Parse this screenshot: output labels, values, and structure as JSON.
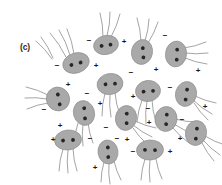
{
  "figure": {
    "panel_label": "(c)",
    "panel_label_x": 20,
    "panel_label_y": 42,
    "width": 222,
    "height": 185,
    "background_color": "#ffffff",
    "cell_fill_color": "#a9a9a9",
    "cell_stroke_color": "#8f8f8f",
    "granule_color": "#262626",
    "flagellum_color": "#9a9a9a",
    "charge_symbol_color": "#1a1a1a"
  },
  "chart_data": {
    "type": "scatter",
    "title": "(c)",
    "xlabel": "",
    "ylabel": "",
    "xlim": [
      0,
      222
    ],
    "ylim": [
      0,
      185
    ],
    "grid": false,
    "legend": "none",
    "cell_count": 16,
    "charge_count": 28,
    "cells": [
      {
        "id": "cell-1",
        "cx": 76,
        "cy": 63,
        "rx": 13.5,
        "ry": 10.0,
        "rot": -18,
        "granules": [
          [
            -5.0,
            0.5
          ],
          [
            4.5,
            1.0
          ]
        ],
        "flagella": [
          [
            -10,
            -6,
            -26,
            -30
          ],
          [
            -6,
            -8,
            -17,
            -33
          ],
          [
            -2,
            -9,
            -9,
            -34
          ]
        ]
      },
      {
        "id": "cell-2",
        "cx": 106,
        "cy": 45,
        "rx": 12.5,
        "ry": 9.5,
        "rot": -12,
        "granules": [
          [
            -4.5,
            0.0
          ],
          [
            4.5,
            0.5
          ]
        ],
        "flagella": [
          [
            -3,
            -8,
            -6,
            -32
          ],
          [
            1,
            -9,
            4,
            -33
          ],
          [
            5,
            -8,
            14,
            -31
          ]
        ]
      },
      {
        "id": "cell-3",
        "cx": 142,
        "cy": 52,
        "rx": 10.5,
        "ry": 12.5,
        "rot": 12,
        "granules": [
          [
            0.0,
            -4.0
          ],
          [
            2.5,
            5.0
          ]
        ],
        "flagella": [
          [
            -1,
            -11,
            -5,
            -34
          ],
          [
            3,
            -11,
            7,
            -33
          ],
          [
            6,
            -9,
            16,
            -30
          ]
        ]
      },
      {
        "id": "cell-4",
        "cx": 176,
        "cy": 54,
        "rx": 10.5,
        "ry": 13.0,
        "rot": 8,
        "granules": [
          [
            0.5,
            -4.5
          ],
          [
            1.5,
            5.5
          ]
        ],
        "flagella": [
          [
            8,
            -6,
            30,
            -12
          ],
          [
            9,
            -1,
            32,
            -1
          ],
          [
            9,
            4,
            31,
            10
          ]
        ]
      },
      {
        "id": "cell-5",
        "cx": 58,
        "cy": 99,
        "rx": 11.5,
        "ry": 12.0,
        "rot": -28,
        "granules": [
          [
            2.0,
            -4.0
          ],
          [
            -1.0,
            5.5
          ]
        ],
        "flagella": [
          [
            -10,
            -4,
            -32,
            -12
          ],
          [
            -11,
            0,
            -33,
            -1
          ],
          [
            -10,
            4,
            -31,
            10
          ]
        ]
      },
      {
        "id": "cell-6",
        "cx": 110,
        "cy": 84,
        "rx": 13.0,
        "ry": 10.5,
        "rot": -10,
        "granules": [
          [
            -4.5,
            -0.5
          ],
          [
            5.0,
            0.5
          ]
        ],
        "flagella": [
          [
            -5,
            9,
            -8,
            32
          ],
          [
            0,
            10,
            1,
            33
          ],
          [
            5,
            9,
            10,
            31
          ]
        ]
      },
      {
        "id": "cell-7",
        "cx": 148,
        "cy": 91,
        "rx": 12.5,
        "ry": 10.5,
        "rot": -8,
        "granules": [
          [
            -4.5,
            0.0
          ],
          [
            5.0,
            0.5
          ]
        ],
        "flagella": [
          [
            -6,
            9,
            -11,
            31
          ],
          [
            -1,
            10,
            -2,
            33
          ],
          [
            4,
            9,
            8,
            31
          ]
        ]
      },
      {
        "id": "cell-8",
        "cx": 186,
        "cy": 94,
        "rx": 10.5,
        "ry": 12.5,
        "rot": 14,
        "granules": [
          [
            0.0,
            -4.5
          ],
          [
            1.0,
            5.5
          ]
        ],
        "flagella": [
          [
            7,
            6,
            26,
            20
          ],
          [
            9,
            2,
            30,
            9
          ],
          [
            8,
            9,
            22,
            26
          ]
        ]
      },
      {
        "id": "cell-9",
        "cx": 84,
        "cy": 113,
        "rx": 10.5,
        "ry": 12.5,
        "rot": -16,
        "granules": [
          [
            1.5,
            -4.5
          ],
          [
            -0.5,
            5.5
          ]
        ],
        "flagella": [
          [
            -6,
            10,
            -10,
            31
          ],
          [
            -1,
            11,
            -1,
            33
          ],
          [
            4,
            10,
            9,
            30
          ]
        ]
      },
      {
        "id": "cell-10",
        "cx": 126,
        "cy": 118,
        "rx": 10.5,
        "ry": 12.5,
        "rot": 10,
        "granules": [
          [
            0.0,
            -4.5
          ],
          [
            1.5,
            5.0
          ]
        ],
        "flagella": [
          [
            7,
            7,
            26,
            19
          ],
          [
            9,
            3,
            30,
            10
          ],
          [
            7,
            10,
            21,
            26
          ]
        ]
      },
      {
        "id": "cell-11",
        "cx": 166,
        "cy": 119,
        "rx": 11.0,
        "ry": 12.5,
        "rot": 10,
        "granules": [
          [
            0.0,
            -4.5
          ],
          [
            1.0,
            5.0
          ]
        ],
        "flagella": [
          [
            8,
            5,
            28,
            15
          ],
          [
            9,
            0,
            31,
            3
          ],
          [
            7,
            9,
            23,
            24
          ]
        ]
      },
      {
        "id": "cell-12",
        "cx": 196,
        "cy": 133,
        "rx": 10.5,
        "ry": 12.5,
        "rot": 12,
        "granules": [
          [
            0.0,
            -4.5
          ],
          [
            1.0,
            5.5
          ]
        ],
        "flagella": [
          [
            7,
            7,
            24,
            22
          ],
          [
            9,
            3,
            29,
            12
          ],
          [
            6,
            10,
            18,
            28
          ]
        ]
      },
      {
        "id": "cell-13",
        "cx": 68,
        "cy": 140,
        "rx": 13.5,
        "ry": 10.0,
        "rot": -6,
        "granules": [
          [
            -5.0,
            0.0
          ],
          [
            5.0,
            0.5
          ]
        ],
        "flagella": [
          [
            -5,
            9,
            -9,
            31
          ],
          [
            0,
            10,
            0,
            33
          ],
          [
            5,
            9,
            9,
            31
          ]
        ]
      },
      {
        "id": "cell-14",
        "cx": 108,
        "cy": 152,
        "rx": 10.0,
        "ry": 12.0,
        "rot": -8,
        "granules": [
          [
            0.5,
            -4.5
          ],
          [
            -0.5,
            5.0
          ]
        ],
        "flagella": [
          [
            -4,
            10,
            -7,
            30
          ],
          [
            1,
            11,
            2,
            32
          ],
          [
            6,
            9,
            13,
            28
          ]
        ]
      },
      {
        "id": "cell-15",
        "cx": 150,
        "cy": 150,
        "rx": 13.5,
        "ry": 10.0,
        "rot": -4,
        "granules": [
          [
            -5.0,
            -0.5
          ],
          [
            5.0,
            0.5
          ]
        ],
        "flagella": [
          [
            -5,
            9,
            -9,
            30
          ],
          [
            0,
            10,
            0,
            32
          ],
          [
            6,
            9,
            12,
            29
          ]
        ]
      },
      {
        "id": "cell-16",
        "cx": 54,
        "cy": 61,
        "rx": 0.1,
        "ry": 0.1,
        "rot": 0,
        "granules": [],
        "flagella": [
          [
            -2,
            -2,
            -18,
            -20
          ],
          [
            -1,
            -3,
            -13,
            -24
          ]
        ]
      }
    ],
    "charges": [
      {
        "sign": "−",
        "x": 57,
        "y": 66
      },
      {
        "sign": "+",
        "x": 96,
        "y": 66
      },
      {
        "sign": "−",
        "x": 89,
        "y": 41
      },
      {
        "sign": "+",
        "x": 124,
        "y": 42
      },
      {
        "sign": "+",
        "x": 156,
        "y": 70
      },
      {
        "sign": "−",
        "x": 165,
        "y": 36
      },
      {
        "sign": "+",
        "x": 198,
        "y": 71
      },
      {
        "sign": "+",
        "x": 68,
        "y": 85
      },
      {
        "sign": "−",
        "x": 44,
        "y": 110
      },
      {
        "sign": "−",
        "x": 87,
        "y": 94
      },
      {
        "sign": "−",
        "x": 131,
        "y": 73
      },
      {
        "sign": "−",
        "x": 170,
        "y": 88
      },
      {
        "sign": "+",
        "x": 133,
        "y": 97
      },
      {
        "sign": "+",
        "x": 205,
        "y": 107
      },
      {
        "sign": "+",
        "x": 100,
        "y": 104
      },
      {
        "sign": "−",
        "x": 106,
        "y": 128
      },
      {
        "sign": "−",
        "x": 148,
        "y": 109
      },
      {
        "sign": "+",
        "x": 149,
        "y": 123
      },
      {
        "sign": "−",
        "x": 182,
        "y": 120
      },
      {
        "sign": "+",
        "x": 60,
        "y": 126
      },
      {
        "sign": "+",
        "x": 53,
        "y": 140
      },
      {
        "sign": "−",
        "x": 90,
        "y": 139
      },
      {
        "sign": "−",
        "x": 117,
        "y": 139
      },
      {
        "sign": "+",
        "x": 127,
        "y": 140
      },
      {
        "sign": "−",
        "x": 133,
        "y": 152
      },
      {
        "sign": "+",
        "x": 170,
        "y": 152
      },
      {
        "sign": "+",
        "x": 180,
        "y": 139
      },
      {
        "sign": "+",
        "x": 95,
        "y": 168
      }
    ]
  }
}
